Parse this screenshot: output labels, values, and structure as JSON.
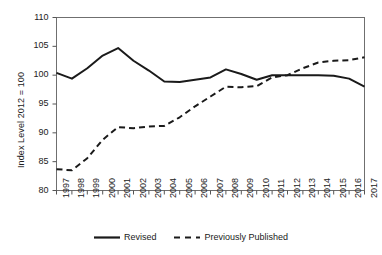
{
  "chart_data": {
    "type": "line",
    "title": "",
    "xlabel": "",
    "ylabel": "Index Level 2012 = 100",
    "xlim": [
      1997,
      2017
    ],
    "ylim": [
      80,
      110
    ],
    "ytick_step": 5,
    "yticks": [
      80,
      85,
      90,
      95,
      100,
      105,
      110
    ],
    "grid": false,
    "legend_position": "bottom",
    "categories": [
      1997,
      1998,
      1999,
      2000,
      2001,
      2002,
      2003,
      2004,
      2005,
      2006,
      2007,
      2008,
      2009,
      2010,
      2011,
      2012,
      2013,
      2014,
      2015,
      2016,
      2017
    ],
    "xtick_labels": [
      "1997",
      "1998",
      "1999",
      "2000",
      "2001",
      "2002",
      "2003",
      "2004",
      "2005",
      "2006",
      "2007",
      "2008",
      "2009",
      "2010",
      "2011",
      "2012",
      "2013",
      "2014",
      "2015",
      "2016",
      "2017"
    ],
    "series": [
      {
        "name": "Revised",
        "style": "solid",
        "color": "#1a1a1a",
        "values": [
          100.4,
          99.4,
          101.2,
          103.4,
          104.7,
          102.5,
          100.8,
          98.9,
          98.8,
          99.2,
          99.6,
          101.0,
          100.2,
          99.2,
          100.0,
          100.0,
          100.0,
          100.0,
          99.9,
          99.4,
          98.0
        ]
      },
      {
        "name": "Previously Published",
        "style": "dashed",
        "color": "#1a1a1a",
        "values": [
          83.7,
          83.5,
          85.6,
          88.8,
          91.0,
          90.8,
          91.1,
          91.2,
          92.7,
          94.6,
          96.3,
          98.0,
          97.9,
          98.1,
          99.6,
          100.0,
          101.2,
          102.2,
          102.5,
          102.6,
          103.1
        ]
      }
    ]
  },
  "legend": {
    "items": [
      {
        "label": "Revised",
        "style": "solid"
      },
      {
        "label": "Previously Published",
        "style": "dashed"
      }
    ]
  }
}
